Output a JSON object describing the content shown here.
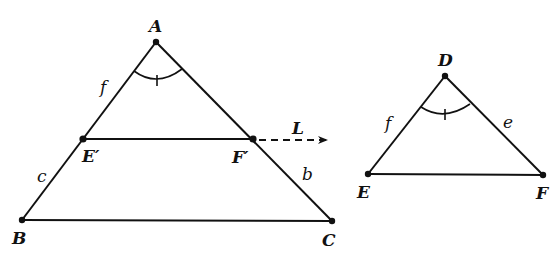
{
  "diagram": {
    "colors": {
      "stroke": "#111111",
      "background": "#ffffff"
    },
    "triangle_ABC": {
      "vertices": {
        "A": {
          "label": "A",
          "x": 156,
          "y": 42
        },
        "B": {
          "label": "B",
          "x": 22,
          "y": 220
        },
        "C": {
          "label": "C",
          "x": 332,
          "y": 221
        }
      },
      "points_on_sides": {
        "E_prime": {
          "label": "E′",
          "x": 83,
          "y": 139
        },
        "F_prime": {
          "label": "F′",
          "x": 253,
          "y": 139
        }
      },
      "side_labels": {
        "f": "f",
        "c": "c",
        "b": "b"
      },
      "line_label": "L"
    },
    "triangle_DEF": {
      "vertices": {
        "D": {
          "label": "D",
          "x": 445,
          "y": 76
        },
        "E": {
          "label": "E",
          "x": 368,
          "y": 174
        },
        "F": {
          "label": "F",
          "x": 543,
          "y": 175
        }
      },
      "side_labels": {
        "f": "f",
        "e": "e"
      }
    }
  }
}
